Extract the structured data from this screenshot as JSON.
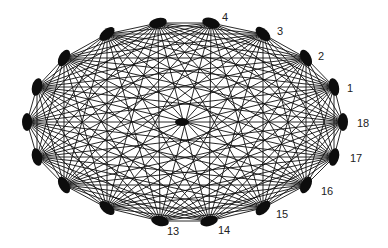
{
  "diagram": {
    "type": "complete-graph",
    "name": "K18",
    "layout": "ellipse",
    "edge_color": "#111111",
    "vertex_color": "#0d0d0d",
    "background": "#ffffff",
    "vertices": [
      {
        "id": "1",
        "x": 334,
        "y": 87,
        "label": "1",
        "lx": 347,
        "ly": 92,
        "labeled": true
      },
      {
        "id": "2",
        "x": 306,
        "y": 58,
        "label": "2",
        "lx": 318,
        "ly": 60,
        "labeled": true
      },
      {
        "id": "3",
        "x": 263,
        "y": 34,
        "label": "3",
        "lx": 277,
        "ly": 35,
        "labeled": true
      },
      {
        "id": "4",
        "x": 211,
        "y": 23,
        "label": "4",
        "lx": 222,
        "ly": 21,
        "labeled": true
      },
      {
        "id": "5",
        "x": 158,
        "y": 23,
        "label": "5",
        "lx": 0,
        "ly": 0,
        "labeled": false
      },
      {
        "id": "6",
        "x": 107,
        "y": 34,
        "label": "6",
        "lx": 0,
        "ly": 0,
        "labeled": false
      },
      {
        "id": "7",
        "x": 64,
        "y": 58,
        "label": "7",
        "lx": 0,
        "ly": 0,
        "labeled": false
      },
      {
        "id": "8",
        "x": 37,
        "y": 87,
        "label": "8",
        "lx": 0,
        "ly": 0,
        "labeled": false
      },
      {
        "id": "9",
        "x": 27,
        "y": 122,
        "label": "9",
        "lx": 0,
        "ly": 0,
        "labeled": false
      },
      {
        "id": "10",
        "x": 37,
        "y": 157,
        "label": "10",
        "lx": 0,
        "ly": 0,
        "labeled": false
      },
      {
        "id": "11",
        "x": 64,
        "y": 185,
        "label": "11",
        "lx": 0,
        "ly": 0,
        "labeled": false
      },
      {
        "id": "12",
        "x": 107,
        "y": 208,
        "label": "12",
        "lx": 0,
        "ly": 0,
        "labeled": false
      },
      {
        "id": "13",
        "x": 160,
        "y": 221,
        "label": "13",
        "lx": 167,
        "ly": 235,
        "labeled": true
      },
      {
        "id": "14",
        "x": 209,
        "y": 221,
        "label": "14",
        "lx": 218,
        "ly": 234,
        "labeled": true
      },
      {
        "id": "15",
        "x": 263,
        "y": 208,
        "label": "15",
        "lx": 276,
        "ly": 218,
        "labeled": true
      },
      {
        "id": "16",
        "x": 306,
        "y": 185,
        "label": "16",
        "lx": 321,
        "ly": 195,
        "labeled": true
      },
      {
        "id": "17",
        "x": 334,
        "y": 157,
        "label": "17",
        "lx": 350,
        "ly": 162,
        "labeled": true
      },
      {
        "id": "18",
        "x": 343,
        "y": 122,
        "label": "18",
        "lx": 357,
        "ly": 127,
        "labeled": true
      }
    ],
    "edges": "all-pairs",
    "vertex_radius": {
      "rx": 9,
      "ry": 5
    },
    "center_hub": {
      "x": 182,
      "y": 122,
      "rx": 7,
      "ry": 4
    }
  }
}
